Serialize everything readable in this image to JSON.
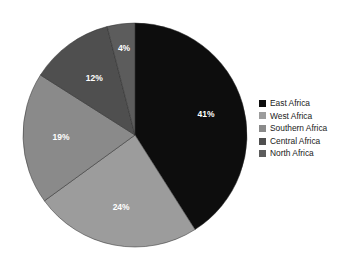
{
  "chart_data": {
    "type": "pie",
    "title": "",
    "subtitle": "",
    "xlabel": "",
    "ylabel": "",
    "grid": false,
    "legend_position": "right",
    "categories": [
      "East Africa",
      "West Africa",
      "Southern Africa",
      "Central Africa",
      "North Africa"
    ],
    "values": [
      41,
      24,
      19,
      12,
      4
    ],
    "unit": "%",
    "data_labels": [
      "41%",
      "24%",
      "19%",
      "12%",
      "4%"
    ],
    "colors": [
      "#0d0d0d",
      "#9c9c9c",
      "#8a8a8a",
      "#4f4f4f",
      "#5c5c5c"
    ],
    "start_angle_deg": 0,
    "direction": "clockwise",
    "slices": [
      {
        "label": "East Africa",
        "value": 41,
        "data_label": "41%",
        "color": "#0d0d0d",
        "label_color": "#ffffff"
      },
      {
        "label": "West Africa",
        "value": 24,
        "data_label": "24%",
        "color": "#9c9c9c",
        "label_color": "#ffffff"
      },
      {
        "label": "Southern Africa",
        "value": 19,
        "data_label": "19%",
        "color": "#8a8a8a",
        "label_color": "#ffffff"
      },
      {
        "label": "Central Africa",
        "value": 12,
        "data_label": "12%",
        "color": "#4f4f4f",
        "label_color": "#ffffff"
      },
      {
        "label": "North Africa",
        "value": 4,
        "data_label": "4%",
        "color": "#5c5c5c",
        "label_color": "#ffffff"
      }
    ]
  },
  "legend": {
    "items": [
      {
        "label": "East Africa",
        "color": "#0d0d0d"
      },
      {
        "label": "West Africa",
        "color": "#9c9c9c"
      },
      {
        "label": "Southern Africa",
        "color": "#8a8a8a"
      },
      {
        "label": "Central Africa",
        "color": "#4f4f4f"
      },
      {
        "label": "North Africa",
        "color": "#5c5c5c"
      }
    ]
  }
}
